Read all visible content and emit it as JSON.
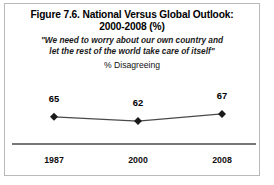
{
  "figure": {
    "title_lines": [
      "Figure 7.6. National Versus Global Outlook:",
      "2000-2008 (%)"
    ],
    "quote_lines": [
      "\"We need to worry about our own country and",
      "let the rest of the world take care of itself\""
    ],
    "unit_label": "% Disagreeing",
    "border_color": "#b9b9b9",
    "background_color": "#ffffff"
  },
  "chart_data": {
    "type": "line",
    "title": "Figure 7.6. National Versus Global Outlook: 2000-2008 (%)",
    "subtitle": "\"We need to worry about our own country and let the rest of the world take care of itself\"",
    "ylabel": "% Disagreeing",
    "xlabel": "",
    "categories": [
      "1987",
      "2000",
      "2008"
    ],
    "values": [
      65,
      62,
      67
    ],
    "point_labels": [
      "65",
      "62",
      "67"
    ],
    "marker": "diamond",
    "marker_color": "#1a1a1a",
    "line_color": "#4a4a4a",
    "axis_line_color": "#4a4a4a",
    "grid": false,
    "legend": false,
    "ylim": [
      60,
      69
    ]
  }
}
